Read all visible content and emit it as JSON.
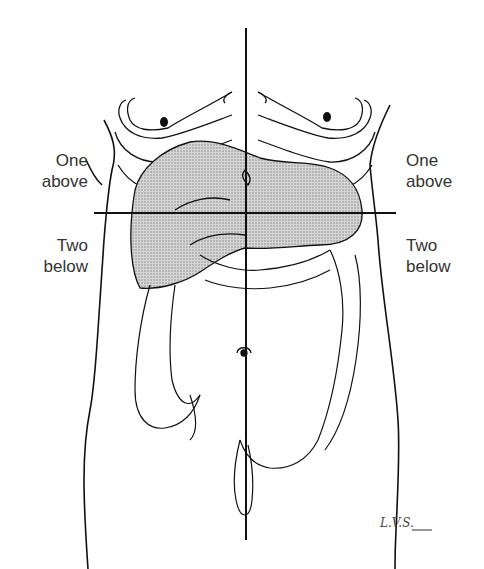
{
  "figure": {
    "labels": {
      "left_upper": {
        "line1": "One",
        "line2": "above"
      },
      "left_lower": {
        "line1": "Two",
        "line2": "below"
      },
      "right_upper": {
        "line1": "One",
        "line2": "above"
      },
      "right_lower": {
        "line1": "Two",
        "line2": "below"
      }
    },
    "signature": "L.V.S."
  }
}
